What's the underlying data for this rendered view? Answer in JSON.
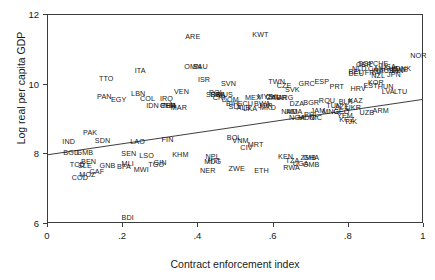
{
  "chart_data": {
    "type": "scatter",
    "title": "",
    "xlabel": "Contract enforcement index",
    "ylabel": "Log real per capita GDP",
    "xlim": [
      0,
      1
    ],
    "ylim": [
      6,
      12
    ],
    "xticks": [
      "0",
      ".2",
      ".4",
      ".6",
      ".8",
      "1"
    ],
    "xtick_values": [
      0,
      0.2,
      0.4,
      0.6,
      0.8,
      1
    ],
    "yticks": [
      "6",
      "8",
      "10",
      "12"
    ],
    "ytick_values": [
      6,
      8,
      10,
      12
    ],
    "grid": false,
    "legend": null,
    "marker_style": "text-label-only",
    "trend_line": {
      "type": "linear-fit",
      "x_start": 0.0,
      "y_start": 7.95,
      "x_end": 1.0,
      "y_end": 9.55
    },
    "points": [
      {
        "label": "ARE",
        "x": 0.385,
        "y": 11.38
      },
      {
        "label": "KWT",
        "x": 0.565,
        "y": 11.42
      },
      {
        "label": "OMN",
        "x": 0.385,
        "y": 10.52
      },
      {
        "label": "SAU",
        "x": 0.405,
        "y": 10.52
      },
      {
        "label": "NOR",
        "x": 0.985,
        "y": 10.82
      },
      {
        "label": "ITA",
        "x": 0.245,
        "y": 10.38
      },
      {
        "label": "TTO",
        "x": 0.155,
        "y": 10.15
      },
      {
        "label": "ISR",
        "x": 0.415,
        "y": 10.12
      },
      {
        "label": "CHE",
        "x": 0.885,
        "y": 10.58
      },
      {
        "label": "USA",
        "x": 0.905,
        "y": 10.52
      },
      {
        "label": "GBR",
        "x": 0.84,
        "y": 10.56
      },
      {
        "label": "SGP",
        "x": 0.845,
        "y": 10.58
      },
      {
        "label": "AUT",
        "x": 0.912,
        "y": 10.46
      },
      {
        "label": "DNK",
        "x": 0.945,
        "y": 10.46
      },
      {
        "label": "SWE",
        "x": 0.935,
        "y": 10.42
      },
      {
        "label": "FIN",
        "x": 0.93,
        "y": 10.38
      },
      {
        "label": "NLD",
        "x": 0.828,
        "y": 10.44
      },
      {
        "label": "BEL",
        "x": 0.818,
        "y": 10.36
      },
      {
        "label": "DEU",
        "x": 0.82,
        "y": 10.3
      },
      {
        "label": "CAN",
        "x": 0.872,
        "y": 10.44
      },
      {
        "label": "AUS",
        "x": 0.9,
        "y": 10.4
      },
      {
        "label": "FRA",
        "x": 0.862,
        "y": 10.34
      },
      {
        "label": "IRL",
        "x": 0.876,
        "y": 10.38
      },
      {
        "label": "ISL",
        "x": 0.922,
        "y": 10.4
      },
      {
        "label": "JPN",
        "x": 0.92,
        "y": 10.28
      },
      {
        "label": "NZL",
        "x": 0.878,
        "y": 10.25
      },
      {
        "label": "KOR",
        "x": 0.872,
        "y": 10.05
      },
      {
        "label": "ESP",
        "x": 0.728,
        "y": 10.08
      },
      {
        "label": "GRC",
        "x": 0.688,
        "y": 10.02
      },
      {
        "label": "TWN",
        "x": 0.608,
        "y": 10.08
      },
      {
        "label": "CZE",
        "x": 0.628,
        "y": 9.95
      },
      {
        "label": "PRT",
        "x": 0.768,
        "y": 9.92
      },
      {
        "label": "SVN",
        "x": 0.48,
        "y": 10.02
      },
      {
        "label": "SVK",
        "x": 0.65,
        "y": 9.86
      },
      {
        "label": "POL",
        "x": 0.448,
        "y": 9.75
      },
      {
        "label": "VEN",
        "x": 0.355,
        "y": 9.78
      },
      {
        "label": "EST",
        "x": 0.858,
        "y": 9.95
      },
      {
        "label": "HUN",
        "x": 0.898,
        "y": 9.93
      },
      {
        "label": "HRV",
        "x": 0.825,
        "y": 9.88
      },
      {
        "label": "LVA",
        "x": 0.905,
        "y": 9.8
      },
      {
        "label": "LTU",
        "x": 0.938,
        "y": 9.78
      },
      {
        "label": "MUS",
        "x": 0.47,
        "y": 9.7
      },
      {
        "label": "SRB",
        "x": 0.44,
        "y": 9.7
      },
      {
        "label": "BRA",
        "x": 0.452,
        "y": 9.7
      },
      {
        "label": "LBN",
        "x": 0.24,
        "y": 9.72
      },
      {
        "label": "PAN",
        "x": 0.15,
        "y": 9.65
      },
      {
        "label": "COL",
        "x": 0.265,
        "y": 9.6
      },
      {
        "label": "IRQ",
        "x": 0.315,
        "y": 9.6
      },
      {
        "label": "CRI",
        "x": 0.455,
        "y": 9.62
      },
      {
        "label": "DOM",
        "x": 0.485,
        "y": 9.56
      },
      {
        "label": "EGY",
        "x": 0.188,
        "y": 9.55
      },
      {
        "label": "MEX",
        "x": 0.545,
        "y": 9.62
      },
      {
        "label": "MYS",
        "x": 0.578,
        "y": 9.66
      },
      {
        "label": "CHL",
        "x": 0.598,
        "y": 9.66
      },
      {
        "label": "TUR",
        "x": 0.615,
        "y": 9.62
      },
      {
        "label": "ZAF",
        "x": 0.6,
        "y": 9.62
      },
      {
        "label": "ARG",
        "x": 0.632,
        "y": 9.62
      },
      {
        "label": "ROU",
        "x": 0.742,
        "y": 9.52
      },
      {
        "label": "BGR",
        "x": 0.7,
        "y": 9.48
      },
      {
        "label": "DZA",
        "x": 0.662,
        "y": 9.45
      },
      {
        "label": "BWA",
        "x": 0.57,
        "y": 9.45
      },
      {
        "label": "KAZ",
        "x": 0.818,
        "y": 9.52
      },
      {
        "label": "BLR",
        "x": 0.792,
        "y": 9.5
      },
      {
        "label": "BIH",
        "x": 0.49,
        "y": 9.44
      },
      {
        "label": "SLV",
        "x": 0.498,
        "y": 9.36
      },
      {
        "label": "ECU",
        "x": 0.525,
        "y": 9.44
      },
      {
        "label": "IDN",
        "x": 0.278,
        "y": 9.38
      },
      {
        "label": "MAR",
        "x": 0.348,
        "y": 9.32
      },
      {
        "label": "CHN",
        "x": 0.318,
        "y": 9.38
      },
      {
        "label": "PER",
        "x": 0.32,
        "y": 9.38
      },
      {
        "label": "THA",
        "x": 0.322,
        "y": 9.38
      },
      {
        "label": "ALB",
        "x": 0.52,
        "y": 9.32
      },
      {
        "label": "LKA",
        "x": 0.538,
        "y": 9.3
      },
      {
        "label": "JOR",
        "x": 0.578,
        "y": 9.38
      },
      {
        "label": "MKD",
        "x": 0.585,
        "y": 9.34
      },
      {
        "label": "TUN",
        "x": 0.76,
        "y": 9.38
      },
      {
        "label": "AZE",
        "x": 0.782,
        "y": 9.36
      },
      {
        "label": "UKR",
        "x": 0.812,
        "y": 9.32
      },
      {
        "label": "ARM",
        "x": 0.885,
        "y": 9.25
      },
      {
        "label": "GEO",
        "x": 0.78,
        "y": 9.22
      },
      {
        "label": "MNG",
        "x": 0.752,
        "y": 9.22
      },
      {
        "label": "JAM",
        "x": 0.718,
        "y": 9.25
      },
      {
        "label": "NAM",
        "x": 0.642,
        "y": 9.22
      },
      {
        "label": "MDA",
        "x": 0.655,
        "y": 9.22
      },
      {
        "label": "UZB",
        "x": 0.848,
        "y": 9.18
      },
      {
        "label": "PHL",
        "x": 0.7,
        "y": 9.12
      },
      {
        "label": "NIC",
        "x": 0.712,
        "y": 9.05
      },
      {
        "label": "NGA",
        "x": 0.662,
        "y": 9.05
      },
      {
        "label": "MDG",
        "x": 0.688,
        "y": 9.05
      },
      {
        "label": "YEM",
        "x": 0.79,
        "y": 9.1
      },
      {
        "label": "KGZ",
        "x": 0.795,
        "y": 9.0
      },
      {
        "label": "TJK",
        "x": 0.805,
        "y": 8.92
      },
      {
        "label": "IND",
        "x": 0.055,
        "y": 8.35
      },
      {
        "label": "PAK",
        "x": 0.112,
        "y": 8.62
      },
      {
        "label": "SDN",
        "x": 0.145,
        "y": 8.38
      },
      {
        "label": "LAO",
        "x": 0.238,
        "y": 8.35
      },
      {
        "label": "FIN2",
        "x": 0.318,
        "y": 8.42
      },
      {
        "label": "BOL",
        "x": 0.495,
        "y": 8.48
      },
      {
        "label": "VNM",
        "x": 0.512,
        "y": 8.38
      },
      {
        "label": "MRT",
        "x": 0.552,
        "y": 8.28
      },
      {
        "label": "CIV",
        "x": 0.528,
        "y": 8.18
      },
      {
        "label": "BGD",
        "x": 0.062,
        "y": 8.05
      },
      {
        "label": "GMB2",
        "x": 0.098,
        "y": 8.05
      },
      {
        "label": "SEN",
        "x": 0.215,
        "y": 8.0
      },
      {
        "label": "LSO",
        "x": 0.262,
        "y": 7.95
      },
      {
        "label": "KHM",
        "x": 0.352,
        "y": 7.98
      },
      {
        "label": "NPL",
        "x": 0.438,
        "y": 7.92
      },
      {
        "label": "HTI",
        "x": 0.44,
        "y": 7.82
      },
      {
        "label": "MDG2",
        "x": 0.438,
        "y": 7.78
      },
      {
        "label": "KEN",
        "x": 0.632,
        "y": 7.92
      },
      {
        "label": "TZA",
        "x": 0.65,
        "y": 7.82
      },
      {
        "label": "UGA",
        "x": 0.672,
        "y": 7.72
      },
      {
        "label": "GMB",
        "x": 0.7,
        "y": 7.7
      },
      {
        "label": "RWA",
        "x": 0.648,
        "y": 7.62
      },
      {
        "label": "ZMB",
        "x": 0.692,
        "y": 7.9
      },
      {
        "label": "GHA",
        "x": 0.7,
        "y": 7.9
      },
      {
        "label": "BEN",
        "x": 0.108,
        "y": 7.78
      },
      {
        "label": "TCD",
        "x": 0.078,
        "y": 7.68
      },
      {
        "label": "SLE",
        "x": 0.098,
        "y": 7.66
      },
      {
        "label": "GNB",
        "x": 0.158,
        "y": 7.66
      },
      {
        "label": "BFA",
        "x": 0.202,
        "y": 7.64
      },
      {
        "label": "MLI",
        "x": 0.212,
        "y": 7.72
      },
      {
        "label": "TGO",
        "x": 0.288,
        "y": 7.7
      },
      {
        "label": "GIN",
        "x": 0.298,
        "y": 7.76
      },
      {
        "label": "MWI",
        "x": 0.248,
        "y": 7.55
      },
      {
        "label": "CAF",
        "x": 0.13,
        "y": 7.48
      },
      {
        "label": "MOZ",
        "x": 0.105,
        "y": 7.42
      },
      {
        "label": "COD",
        "x": 0.085,
        "y": 7.32
      },
      {
        "label": "NER",
        "x": 0.425,
        "y": 7.52
      },
      {
        "label": "ZWE",
        "x": 0.502,
        "y": 7.58
      },
      {
        "label": "ETH",
        "x": 0.568,
        "y": 7.52
      },
      {
        "label": "BDI",
        "x": 0.212,
        "y": 6.18
      }
    ]
  },
  "display_labels": {
    "FIN2": "FIN",
    "GMB2": "GMB",
    "MDG2": "MDG"
  }
}
